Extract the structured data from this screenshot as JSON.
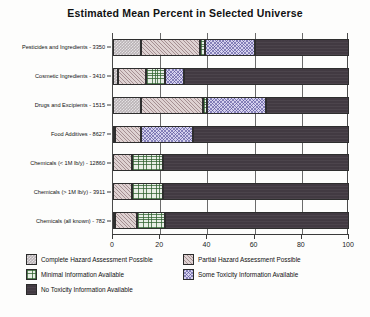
{
  "chart_data": {
    "type": "bar",
    "orientation": "horizontal",
    "stacked": true,
    "stack_mode": "percent",
    "title": "Estimated Mean Percent in Selected Universe",
    "xlabel": "",
    "ylabel": "",
    "xlim": [
      0,
      100
    ],
    "xticks": [
      0,
      20,
      40,
      60,
      80,
      100
    ],
    "xticklabels": [
      "0",
      "20",
      "40",
      "60",
      "80",
      "100"
    ],
    "grid": true,
    "grid_axis": "x",
    "legend_position": "below",
    "categories": [
      "Pesticides and Ingredients - 3350",
      "Cosmetic Ingredients - 3410",
      "Drugs and Excipients - 1515",
      "Food Additives - 8627",
      "Chemicals (< 1M lb/y) - 12860",
      "Chemicals (> 1M lb/y) - 3911",
      "Chemicals (all known) - 782"
    ],
    "series": [
      {
        "name": "Complete Hazard Assessment Possible",
        "color": "#b9b3b6",
        "pattern": "dotted-checker",
        "values": [
          12,
          2,
          12,
          1,
          0,
          0,
          1
        ]
      },
      {
        "name": "Partial Hazard Assessment Possible",
        "color": "#ded2d2",
        "pattern": "diagonal-hatch",
        "values": [
          25,
          12,
          26,
          11,
          8,
          8,
          9
        ]
      },
      {
        "name": "Minimal Information Available",
        "color": "#e8eee6",
        "pattern": "cross-hatch-green",
        "values": [
          2,
          8,
          2,
          0,
          13,
          13,
          12
        ]
      },
      {
        "name": "Some Toxicity Information Available",
        "color": "#d6d2ee",
        "pattern": "cross-hatch-blue",
        "values": [
          21,
          8,
          25,
          22,
          0,
          0,
          0
        ]
      },
      {
        "name": "No Toxicity Information Available",
        "color": "#423a42",
        "pattern": "solid-dark",
        "values": [
          40,
          70,
          35,
          66,
          79,
          79,
          78
        ]
      }
    ]
  },
  "legend": {
    "items": [
      {
        "label": "Complete Hazard Assessment Possible",
        "pattern_class": "p-complete"
      },
      {
        "label": "Partial Hazard Assessment Possible",
        "pattern_class": "p-partial"
      },
      {
        "label": "Minimal Information Available",
        "pattern_class": "p-minimal"
      },
      {
        "label": "Some Toxicity Information Available",
        "pattern_class": "p-some"
      },
      {
        "label": "No Toxicity Information Available",
        "pattern_class": "p-none"
      }
    ]
  }
}
